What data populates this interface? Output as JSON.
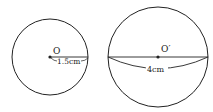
{
  "figure": {
    "type": "geometry-diagram",
    "stroke_color": "#222222",
    "background": "#ffffff"
  },
  "left_sphere": {
    "center_label": "O",
    "radius_label": "1.5cm"
  },
  "right_sphere": {
    "center_label": "O′",
    "diameter_label": "4cm"
  }
}
